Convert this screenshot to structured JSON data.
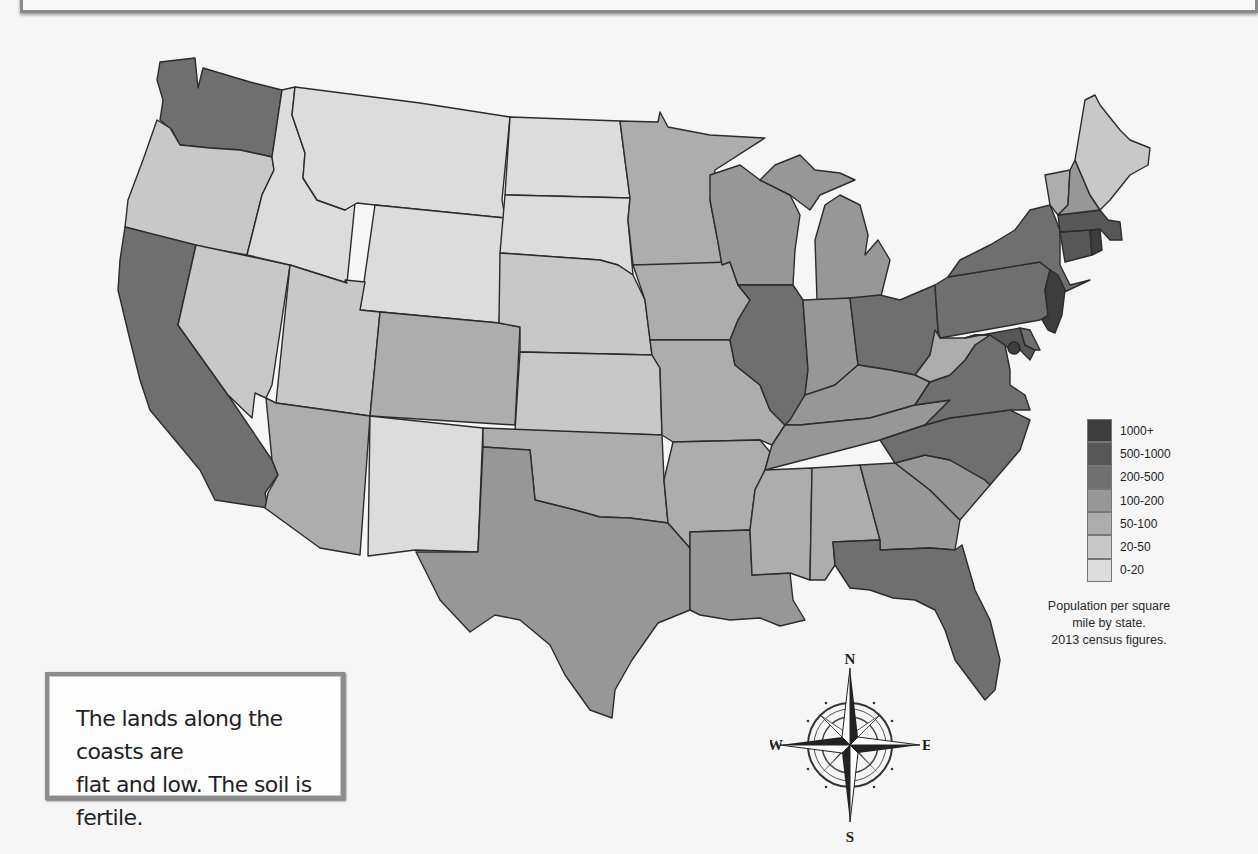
{
  "map": {
    "title": "Population per square mile by state",
    "legend": {
      "items": [
        {
          "label": "1000+",
          "color": "#3d3d3d"
        },
        {
          "label": "500-1000",
          "color": "#575757"
        },
        {
          "label": "200-500",
          "color": "#6f6f6f"
        },
        {
          "label": "100-200",
          "color": "#979797"
        },
        {
          "label": "50-100",
          "color": "#adadad"
        },
        {
          "label": "20-50",
          "color": "#c8c8c8"
        },
        {
          "label": "0-20",
          "color": "#dcdcdc"
        }
      ],
      "caption_lines": [
        "Population per square",
        "mile by state.",
        "2013 census figures."
      ]
    },
    "states": {
      "WA": "200-500",
      "OR": "20-50",
      "CA": "200-500",
      "NV": "20-50",
      "ID": "0-20",
      "MT": "0-20",
      "WY": "0-20",
      "UT": "20-50",
      "AZ": "50-100",
      "CO": "50-100",
      "NM": "0-20",
      "ND": "0-20",
      "SD": "0-20",
      "NE": "20-50",
      "KS": "20-50",
      "OK": "50-100",
      "TX": "100-200",
      "MN": "50-100",
      "IA": "50-100",
      "MO": "50-100",
      "AR": "50-100",
      "LA": "100-200",
      "WI": "100-200",
      "IL": "200-500",
      "MI": "100-200",
      "IN": "100-200",
      "OH": "200-500",
      "KY": "100-200",
      "TN": "100-200",
      "MS": "50-100",
      "AL": "50-100",
      "GA": "100-200",
      "FL": "200-500",
      "SC": "100-200",
      "NC": "200-500",
      "VA": "200-500",
      "WV": "50-100",
      "PA": "200-500",
      "NY": "200-500",
      "MD": "500-1000",
      "DE": "200-500",
      "NJ": "1000+",
      "CT": "500-1000",
      "RI": "1000+",
      "MA": "500-1000",
      "VT": "50-100",
      "NH": "100-200",
      "ME": "20-50",
      "DC": "1000+"
    }
  },
  "compass": {
    "n": "N",
    "s": "S",
    "e": "E",
    "w": "W"
  },
  "caption": {
    "lines": [
      "The lands along the coasts are",
      "flat and low.  The soil is fertile."
    ]
  }
}
